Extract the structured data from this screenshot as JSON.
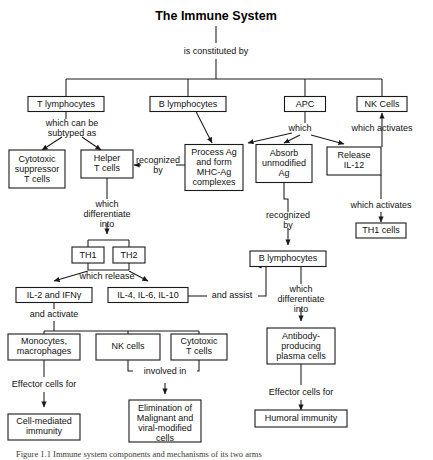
{
  "figure": {
    "title": "The Immune System",
    "caption_prefix": "Figure 1.1",
    "caption_text": "Figure 1.1   Immune system components and mechanisms of its two arms"
  },
  "colors": {
    "box_stroke": "#1a1a1a",
    "box_fill": "#ffffff",
    "text": "#111111",
    "connector": "#1a1a1a",
    "background": "#ffffff"
  },
  "nodes": {
    "immune_system": {
      "label": "The Immune System",
      "x": 216,
      "y": 16,
      "type": "title"
    },
    "t_lymphocytes": {
      "label": "T lymphocytes",
      "x": 66,
      "y": 104,
      "w": 76,
      "h": 15
    },
    "b_lymphocytes_top": {
      "label": "B lymphocytes",
      "x": 188,
      "y": 104,
      "w": 76,
      "h": 15
    },
    "apc": {
      "label": "APC",
      "x": 305,
      "y": 104,
      "w": 41,
      "h": 15
    },
    "nk_cells_top": {
      "label": "NK Cells",
      "x": 382,
      "y": 104,
      "w": 50,
      "h": 15
    },
    "cytotoxic_suppressor_t": {
      "lines": [
        "Cytotoxic",
        "suppressor",
        "T cells"
      ],
      "x": 37,
      "y": 163,
      "w": 56,
      "h": 38
    },
    "helper_t": {
      "lines": [
        "Helper",
        "T cells"
      ],
      "x": 107,
      "y": 163,
      "w": 52,
      "h": 28
    },
    "process_ag": {
      "lines": [
        "Process Ag",
        "and form",
        "MHC-Ag",
        "complexes"
      ],
      "x": 214,
      "y": 168,
      "w": 58,
      "h": 46
    },
    "absorb_ag": {
      "lines": [
        "Absorb",
        "unmodified",
        "Ag"
      ],
      "x": 284,
      "y": 164,
      "w": 56,
      "h": 38
    },
    "release_il12": {
      "lines": [
        "Release",
        "IL-12"
      ],
      "x": 354,
      "y": 161,
      "w": 54,
      "h": 28
    },
    "th1_cells_right": {
      "label": "TH1 cells",
      "x": 381,
      "y": 231,
      "w": 50,
      "h": 15
    },
    "th1": {
      "label": "TH1",
      "x": 88,
      "y": 255,
      "w": 32,
      "h": 16
    },
    "th2": {
      "label": "TH2",
      "x": 129,
      "y": 255,
      "w": 32,
      "h": 16
    },
    "il2_ifng": {
      "label": "IL-2 and IFNγ",
      "x": 54,
      "y": 295,
      "w": 76,
      "h": 15
    },
    "il4_il6_il10": {
      "label": "IL-4, IL-6, IL-10",
      "x": 148,
      "y": 295,
      "w": 80,
      "h": 15
    },
    "b_lymphocytes_lower": {
      "label": "B lymphocytes",
      "x": 288,
      "y": 259,
      "w": 76,
      "h": 15
    },
    "monocytes_macrophages": {
      "lines": [
        "Monocytes,",
        "macrophages"
      ],
      "x": 44,
      "y": 347,
      "w": 72,
      "h": 26
    },
    "nk_cells_lower": {
      "label": "NK cells",
      "x": 128,
      "y": 347,
      "w": 64,
      "h": 26
    },
    "cytotoxic_t_lower": {
      "lines": [
        "Cytotoxic",
        "T cells"
      ],
      "x": 199,
      "y": 347,
      "w": 56,
      "h": 26
    },
    "antibody_plasma": {
      "lines": [
        "Antibody-",
        "producing",
        "plasma cells"
      ],
      "x": 301,
      "y": 346,
      "w": 68,
      "h": 36
    },
    "cell_mediated": {
      "lines": [
        "Cell-mediated",
        "immunity"
      ],
      "x": 44,
      "y": 427,
      "w": 72,
      "h": 26
    },
    "elimination": {
      "lines": [
        "Elimination of",
        "Malignant and",
        "viral-modified",
        "cells"
      ],
      "x": 165,
      "y": 421,
      "w": 72,
      "h": 42
    },
    "humoral": {
      "label": "Humoral immunity",
      "x": 301,
      "y": 424,
      "w": 92,
      "h": 17
    }
  },
  "edge_labels": {
    "is_constituted_by": {
      "text": "is constituted by",
      "x": 216,
      "y": 52
    },
    "which_can_be_subtyped_as": {
      "lines": [
        "which can be",
        "subtyped as"
      ],
      "x": 72,
      "y": 127
    },
    "recognized_by_1": {
      "lines": [
        "recognized",
        "by"
      ],
      "x": 158,
      "y": 165
    },
    "which": {
      "text": "which",
      "x": 300,
      "y": 129
    },
    "which_activates_1": {
      "text": "which activates",
      "x": 382,
      "y": 129
    },
    "which_activates_2": {
      "text": "which activates",
      "x": 381,
      "y": 206
    },
    "which_differentiate_into_1": {
      "lines": [
        "which",
        "differentiate",
        "into"
      ],
      "x": 107,
      "y": 211
    },
    "which_release": {
      "text": "which release",
      "x": 107,
      "y": 277
    },
    "and_activate": {
      "text": "and activate",
      "x": 54,
      "y": 315
    },
    "recognized_by_2": {
      "lines": [
        "recognized",
        "by"
      ],
      "x": 288,
      "y": 220
    },
    "and_assist": {
      "text": "and assist",
      "x": 232,
      "y": 296
    },
    "which_differentiate_into_2": {
      "lines": [
        "which",
        "differentiate",
        "into"
      ],
      "x": 301,
      "y": 296
    },
    "effector_cells_for_1": {
      "text": "Effector cells for",
      "x": 44,
      "y": 385
    },
    "involved_in": {
      "text": "involved in",
      "x": 165,
      "y": 377
    },
    "effector_cells_for_2": {
      "text": "Effector cells for",
      "x": 301,
      "y": 393
    }
  }
}
